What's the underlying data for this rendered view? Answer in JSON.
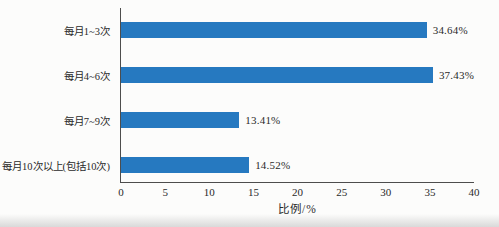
{
  "chart_data": {
    "type": "bar",
    "orientation": "horizontal",
    "categories": [
      "每月1~3次",
      "每月4~6次",
      "每月7~9次",
      "每月10次以上(包括10次)"
    ],
    "values": [
      34.64,
      37.43,
      13.41,
      14.52
    ],
    "value_labels": [
      "34.64%",
      "37.43%",
      "13.41%",
      "14.52%"
    ],
    "xlabel": "比例/%",
    "xlim": [
      0,
      40
    ],
    "xticks": [
      0,
      5,
      10,
      15,
      20,
      25,
      30,
      35,
      40
    ],
    "bar_color": "#2679c0",
    "grid": false,
    "legend": "none",
    "title": ""
  }
}
